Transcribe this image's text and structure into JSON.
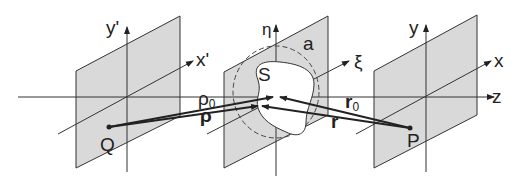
{
  "diagram": {
    "type": "optics-geometry",
    "colors": {
      "plane_fill": "#d9d9d9",
      "line": "#333333",
      "background": "#ffffff"
    },
    "planes": [
      {
        "id": "source",
        "axis_labels": {
          "vertical": "y'",
          "diagonal": "x'"
        },
        "point": "Q"
      },
      {
        "id": "aperture",
        "axis_labels": {
          "vertical": "η",
          "diagonal": "ξ"
        },
        "region": "S",
        "radius": "a"
      },
      {
        "id": "observation",
        "axis_labels": {
          "vertical": "y",
          "diagonal": "x"
        },
        "point": "P"
      }
    ],
    "optical_axis": "z",
    "vectors": {
      "rho0": "ρ",
      "rho0_sub": "0",
      "rho": "ρ",
      "r0": "r",
      "r0_sub": "0",
      "r": "r"
    }
  }
}
